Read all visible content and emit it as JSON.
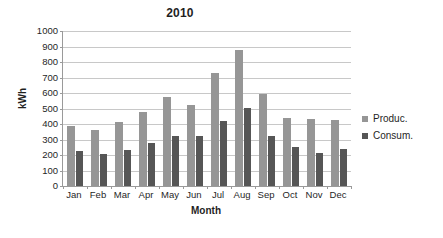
{
  "chart_data": {
    "type": "bar",
    "title": "2010",
    "xlabel": "Month",
    "ylabel": "kWh",
    "ylim": [
      0,
      1000
    ],
    "ytick_step": 100,
    "yticks": [
      1000,
      900,
      800,
      700,
      600,
      500,
      400,
      300,
      200,
      100,
      0
    ],
    "grid": true,
    "legend_position": "right",
    "categories": [
      "Jan",
      "Feb",
      "Mar",
      "Apr",
      "May",
      "Jun",
      "Jul",
      "Aug",
      "Sep",
      "Oct",
      "Nov",
      "Dec"
    ],
    "series": [
      {
        "name": "Produc.",
        "color": "#969696",
        "values": [
          385,
          360,
          410,
          475,
          575,
          520,
          730,
          880,
          595,
          440,
          435,
          425
        ]
      },
      {
        "name": "Consum.",
        "color": "#565656",
        "values": [
          225,
          205,
          230,
          280,
          320,
          325,
          420,
          505,
          320,
          250,
          210,
          240
        ]
      }
    ]
  },
  "legend": {
    "items": [
      {
        "label": "Produc.",
        "swatch": "legend-swatch-produc"
      },
      {
        "label": "Consum.",
        "swatch": "legend-swatch-consum"
      }
    ]
  },
  "colors": {
    "produc": "#969696",
    "consum": "#565656",
    "gridline": "#c8c8c8",
    "axis": "#9a9a9a",
    "text": "#1f1f1f",
    "background": "#ffffff"
  }
}
